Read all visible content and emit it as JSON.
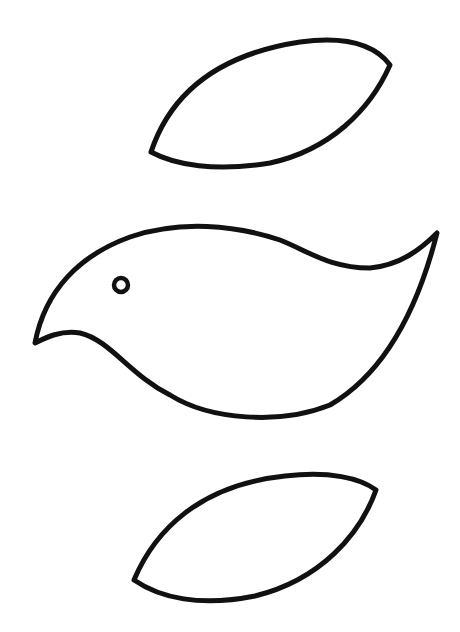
{
  "drawing": {
    "description": "Black line-art template of a bird body with two leaf-shaped wings",
    "background": "#ffffff",
    "stroke_color": "#111111",
    "stroke_width": 5,
    "pieces": [
      {
        "name": "upper-wing",
        "shape": "leaf"
      },
      {
        "name": "bird-body",
        "shape": "bird",
        "eye": {
          "cx": 121,
          "cy": 285,
          "r": 7
        }
      },
      {
        "name": "lower-wing",
        "shape": "leaf"
      }
    ]
  }
}
